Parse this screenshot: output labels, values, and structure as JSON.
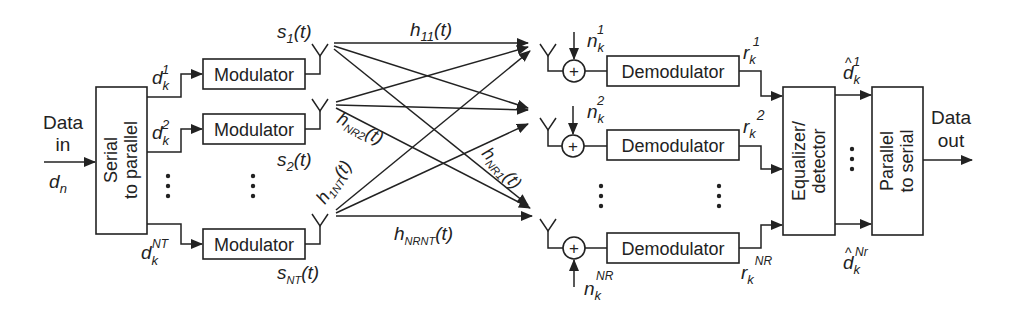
{
  "diagram": {
    "input": {
      "label_line1": "Data",
      "label_line2": "in",
      "symbol": "d",
      "symbol_sub": "n"
    },
    "output": {
      "label_line1": "Data",
      "label_line2": "out"
    },
    "serial_to_parallel": {
      "line1": "Serial",
      "line2": "to parallel"
    },
    "parallel_to_serial": {
      "line1": "Parallel",
      "line2": "to serial"
    },
    "equalizer": {
      "line1": "Equalizer/",
      "line2": "detector"
    },
    "modulator_label": "Modulator",
    "demodulator_label": "Demodulator",
    "sum_symbol": "+",
    "ellipsis": "⋮",
    "tx_branches": [
      {
        "d_sup": "1",
        "s_sub": "1"
      },
      {
        "d_sup": "2",
        "s_sub": "2"
      },
      {
        "d_sup": "NT",
        "s_sub": "NT"
      }
    ],
    "rx_branches": [
      {
        "n_sup": "1",
        "r_sup": "1"
      },
      {
        "n_sup": "2",
        "r_sup": "2"
      },
      {
        "n_sup": "NR",
        "r_sup": "NR"
      }
    ],
    "outputs_hat": [
      {
        "sup": "1"
      },
      {
        "sup": "Nr"
      }
    ],
    "channels": {
      "h11": {
        "base": "h",
        "sub": "11",
        "arg": "(t)"
      },
      "hNR2": {
        "base": "h",
        "sub": "NR2",
        "arg": "(t)"
      },
      "hNR1": {
        "base": "h",
        "sub": "NR1",
        "arg": "(t)"
      },
      "h1NT": {
        "base": "h",
        "sub": "1NT",
        "arg": "(t)"
      },
      "hNRNT": {
        "base": "h",
        "sub": "NRNT",
        "arg": "(t)"
      }
    },
    "var": {
      "d": "d",
      "k": "k",
      "s": "s",
      "t": "(t)",
      "n": "n",
      "r": "r",
      "hat": "^",
      "N": "N"
    },
    "colors": {
      "stroke": "#222222",
      "background": "#ffffff"
    }
  }
}
